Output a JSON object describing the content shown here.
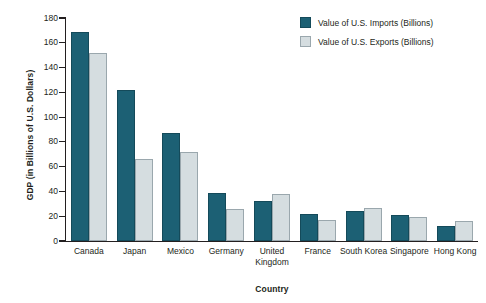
{
  "chart_data": {
    "type": "bar",
    "title": "",
    "xlabel": "Country",
    "ylabel": "GDP (in Billions of U.S. Dollars)",
    "ylim": [
      0,
      180
    ],
    "yticks": [
      0,
      20,
      40,
      60,
      80,
      100,
      120,
      140,
      160,
      180
    ],
    "grid": false,
    "legend_position": "top-right",
    "categories": [
      "Canada",
      "Japan",
      "Mexico",
      "Germany",
      "United Kingdom",
      "France",
      "South Korea",
      "Singapore",
      "Hong Kong"
    ],
    "series": [
      {
        "name": "Value of U.S. Imports (Billions)",
        "color": "#1c6074",
        "values": [
          169,
          122,
          87,
          39,
          32,
          22,
          24,
          21,
          12
        ]
      },
      {
        "name": "Value of U.S. Exports (Billions)",
        "color": "#d5dde0",
        "values": [
          152,
          66,
          72,
          26,
          38,
          17,
          27,
          19,
          16
        ]
      }
    ]
  },
  "legend": {
    "items": [
      {
        "label": "Value of U.S. Imports (Billions)",
        "swatch": "imports"
      },
      {
        "label": "Value of U.S. Exports (Billions)",
        "swatch": "exports"
      }
    ]
  }
}
